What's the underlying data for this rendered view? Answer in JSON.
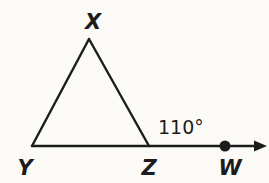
{
  "diagram": {
    "type": "geometry-figure",
    "labels": {
      "apex": "X",
      "bottom_left": "Y",
      "bottom_right": "Z",
      "ray_point": "W"
    },
    "angle_label": "110°",
    "colors": {
      "line": "#1c1c1c",
      "background": "#fbfaf7"
    }
  }
}
